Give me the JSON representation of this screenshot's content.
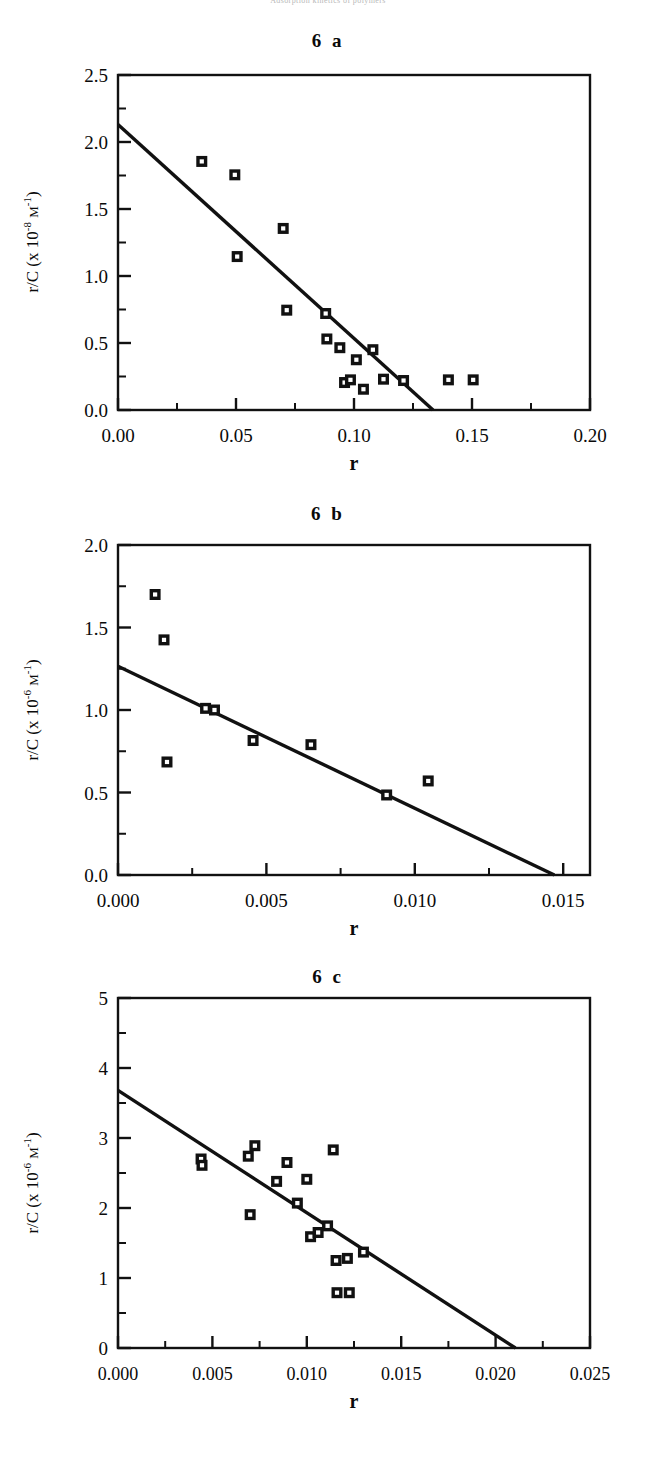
{
  "running_head": "Adsorption kinetics of polymers",
  "figure": {
    "panels": [
      {
        "id": "6a",
        "title": "6 a",
        "axis": {
          "x_label": "r",
          "y_label_prefix": "r/C (x 10",
          "y_label_exp": "-8",
          "y_label_unit": "M",
          "y_label_unit_exp": "-1",
          "y_label_suffix": ")",
          "x_ticks": [
            "0.00",
            "0.05",
            "0.10",
            "0.15",
            "0.20"
          ],
          "y_ticks": [
            "0.0",
            "0.5",
            "1.0",
            "1.5",
            "2.0",
            "2.5"
          ]
        },
        "chart_data": {
          "type": "scatter",
          "title": "6 a",
          "xlabel": "r",
          "ylabel": "r/C (x 10^-8 M^-1)",
          "xlim": [
            0.0,
            0.2
          ],
          "ylim": [
            0.0,
            2.5
          ],
          "x_tick_values": [
            0.0,
            0.05,
            0.1,
            0.15,
            0.2
          ],
          "y_tick_values": [
            0.0,
            0.5,
            1.0,
            1.5,
            2.0,
            2.5
          ],
          "minor_ticks": true,
          "grid": false,
          "legend": null,
          "marker": "open-square-in-filled-square",
          "points": [
            {
              "x": 0.0355,
              "y": 1.855
            },
            {
              "x": 0.0495,
              "y": 1.755
            },
            {
              "x": 0.0505,
              "y": 1.145
            },
            {
              "x": 0.07,
              "y": 1.355
            },
            {
              "x": 0.0715,
              "y": 0.745
            },
            {
              "x": 0.088,
              "y": 0.72
            },
            {
              "x": 0.0885,
              "y": 0.53
            },
            {
              "x": 0.094,
              "y": 0.465
            },
            {
              "x": 0.096,
              "y": 0.205
            },
            {
              "x": 0.0985,
              "y": 0.225
            },
            {
              "x": 0.101,
              "y": 0.375
            },
            {
              "x": 0.104,
              "y": 0.155
            },
            {
              "x": 0.108,
              "y": 0.45
            },
            {
              "x": 0.1125,
              "y": 0.23
            },
            {
              "x": 0.121,
              "y": 0.22
            },
            {
              "x": 0.14,
              "y": 0.225
            },
            {
              "x": 0.1505,
              "y": 0.225
            }
          ],
          "fit_line": {
            "type": "linear",
            "x_start": 0.0,
            "y_start": 2.13,
            "x_end": 0.1335,
            "y_end": 0.0
          }
        }
      },
      {
        "id": "6b",
        "title": "6 b",
        "axis": {
          "x_label": "r",
          "y_label_prefix": "r/C (x 10",
          "y_label_exp": "-6",
          "y_label_unit": "M",
          "y_label_unit_exp": "-1",
          "y_label_suffix": ")",
          "x_ticks": [
            "0.000",
            "0.005",
            "0.010",
            "0.015"
          ],
          "y_ticks": [
            "0.0",
            "0.5",
            "1.0",
            "1.5",
            "2.0"
          ]
        },
        "chart_data": {
          "type": "scatter",
          "title": "6 b",
          "xlabel": "r",
          "ylabel": "r/C (x 10^-6 M^-1)",
          "xlim": [
            0.0,
            0.0159
          ],
          "ylim": [
            0.0,
            2.0
          ],
          "x_tick_values": [
            0.0,
            0.005,
            0.01,
            0.015
          ],
          "y_tick_values": [
            0.0,
            0.5,
            1.0,
            1.5,
            2.0
          ],
          "minor_ticks": true,
          "grid": false,
          "legend": null,
          "marker": "open-square-in-filled-square",
          "points": [
            {
              "x": 0.00125,
              "y": 1.7
            },
            {
              "x": 0.00155,
              "y": 1.425
            },
            {
              "x": 0.00165,
              "y": 0.685
            },
            {
              "x": 0.00295,
              "y": 1.01
            },
            {
              "x": 0.00325,
              "y": 1.0
            },
            {
              "x": 0.00455,
              "y": 0.815
            },
            {
              "x": 0.0065,
              "y": 0.79
            },
            {
              "x": 0.00905,
              "y": 0.485
            },
            {
              "x": 0.01045,
              "y": 0.57
            }
          ],
          "fit_line": {
            "type": "linear",
            "x_start": 0.0,
            "y_start": 1.265,
            "x_end": 0.0147,
            "y_end": 0.0
          }
        }
      },
      {
        "id": "6c",
        "title": "6 c",
        "axis": {
          "x_label": "r",
          "y_label_prefix": "r/C (x 10",
          "y_label_exp": "-6",
          "y_label_unit": "M",
          "y_label_unit_exp": "-1",
          "y_label_suffix": ")",
          "x_ticks": [
            "0.000",
            "0.005",
            "0.010",
            "0.015",
            "0.020",
            "0.025"
          ],
          "y_ticks": [
            "0",
            "1",
            "2",
            "3",
            "4",
            "5"
          ]
        },
        "chart_data": {
          "type": "scatter",
          "title": "6 c",
          "xlabel": "r",
          "ylabel": "r/C (x 10^-6 M^-1)",
          "xlim": [
            0.0,
            0.025
          ],
          "ylim": [
            0,
            5
          ],
          "x_tick_values": [
            0.0,
            0.005,
            0.01,
            0.015,
            0.02,
            0.025
          ],
          "y_tick_values": [
            0,
            1,
            2,
            3,
            4,
            5
          ],
          "minor_ticks": true,
          "grid": false,
          "legend": null,
          "marker": "open-square-in-filled-square",
          "points": [
            {
              "x": 0.0044,
              "y": 2.7
            },
            {
              "x": 0.00445,
              "y": 2.61
            },
            {
              "x": 0.0069,
              "y": 2.74
            },
            {
              "x": 0.007,
              "y": 1.905
            },
            {
              "x": 0.00725,
              "y": 2.89
            },
            {
              "x": 0.0084,
              "y": 2.38
            },
            {
              "x": 0.00895,
              "y": 2.65
            },
            {
              "x": 0.0095,
              "y": 2.07
            },
            {
              "x": 0.01,
              "y": 2.41
            },
            {
              "x": 0.0102,
              "y": 1.59
            },
            {
              "x": 0.0106,
              "y": 1.65
            },
            {
              "x": 0.0111,
              "y": 1.745
            },
            {
              "x": 0.0114,
              "y": 2.83
            },
            {
              "x": 0.01155,
              "y": 1.25
            },
            {
              "x": 0.0116,
              "y": 0.79
            },
            {
              "x": 0.01215,
              "y": 1.28
            },
            {
              "x": 0.01225,
              "y": 0.79
            },
            {
              "x": 0.013,
              "y": 1.37
            }
          ],
          "fit_line": {
            "type": "linear",
            "x_start": 0.0,
            "y_start": 3.68,
            "x_end": 0.02105,
            "y_end": 0.0
          }
        }
      }
    ]
  }
}
